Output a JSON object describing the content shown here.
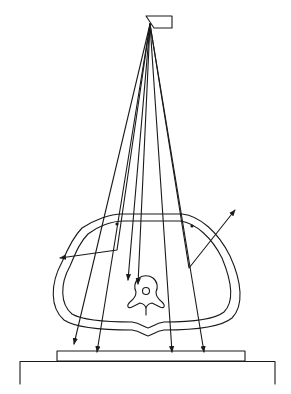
{
  "figure": {
    "caption": "",
    "colors": {
      "line": "#1a1a1a",
      "background": "#ffffff"
    }
  },
  "elements": {
    "source": {
      "label": "X-ray tube (source)",
      "apex": [
        150,
        24
      ]
    },
    "body": {
      "label": "Body cross-section (abdomen) with vertebra"
    },
    "vertebra": {
      "label": "Vertebra"
    },
    "film": {
      "label": "Film / image receptor"
    },
    "table": {
      "label": "Table"
    }
  },
  "beams": [
    {
      "id": "primary-1",
      "type": "primary",
      "end": [
        74,
        344
      ]
    },
    {
      "id": "primary-2",
      "type": "primary",
      "end": [
        97,
        352
      ]
    },
    {
      "id": "scatter-left",
      "type": "scattered",
      "bend": [
        117,
        250
      ],
      "end": [
        60,
        258
      ]
    },
    {
      "id": "primary-3",
      "type": "absorbed",
      "end": [
        128,
        280
      ]
    },
    {
      "id": "primary-4",
      "type": "absorbed",
      "end": [
        138,
        284
      ]
    },
    {
      "id": "primary-5",
      "type": "primary",
      "end": [
        172,
        352
      ]
    },
    {
      "id": "scatter-right",
      "type": "scattered",
      "bend": [
        189,
        268
      ],
      "end": [
        235,
        210
      ]
    },
    {
      "id": "primary-6",
      "type": "primary",
      "end": [
        204,
        352
      ]
    }
  ]
}
